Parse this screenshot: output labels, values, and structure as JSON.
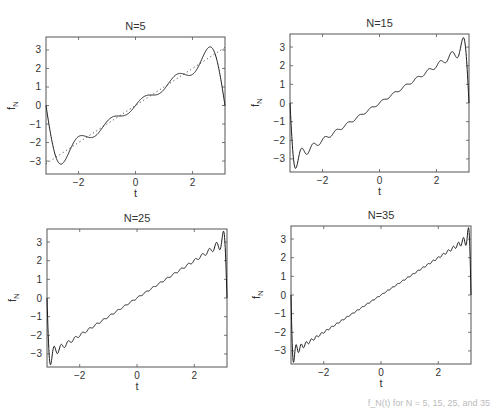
{
  "chart_data": [
    {
      "type": "line",
      "title": "N=5",
      "xlabel": "t",
      "ylabel": "f_N",
      "N": 5,
      "xlim": [
        -3.1416,
        3.1416
      ],
      "ylim": [
        -3.7,
        3.7
      ],
      "xticks": [
        -2,
        0,
        2
      ],
      "yticks": [
        -3,
        -2,
        -1,
        0,
        1,
        2,
        3
      ],
      "series": [
        {
          "name": "f_N(t)",
          "style": "solid",
          "description": "Fourier partial sum of f(t)=t with N=5 terms; peaks near ±3.2 at t≈±2.6"
        },
        {
          "name": "f(t)=t",
          "style": "dotted",
          "description": "reference line y=t"
        }
      ],
      "box": {
        "left": 46,
        "top": 37,
        "right": 225,
        "bottom": 174
      }
    },
    {
      "type": "line",
      "title": "N=15",
      "xlabel": "t",
      "ylabel": "f_N",
      "N": 15,
      "xlim": [
        -3.1416,
        3.1416
      ],
      "ylim": [
        -3.7,
        3.7
      ],
      "xticks": [
        -2,
        0,
        2
      ],
      "yticks": [
        -3,
        -2,
        -1,
        0,
        1,
        2,
        3
      ],
      "series": [
        {
          "name": "f_N(t)",
          "style": "solid",
          "description": "Fourier partial sum with N=15 terms; overshoot ~±3.5 near t≈±2.95"
        }
      ],
      "box": {
        "left": 290,
        "top": 34,
        "right": 469,
        "bottom": 172
      }
    },
    {
      "type": "line",
      "title": "N=25",
      "xlabel": "t",
      "ylabel": "f_N",
      "N": 25,
      "xlim": [
        -3.1416,
        3.1416
      ],
      "ylim": [
        -3.7,
        3.7
      ],
      "xticks": [
        -2,
        0,
        2
      ],
      "yticks": [
        -3,
        -2,
        -1,
        0,
        1,
        2,
        3
      ],
      "series": [
        {
          "name": "f_N(t)",
          "style": "solid",
          "description": "Fourier partial sum with N=25 terms; overshoot ~±3.6 near t≈±3.03"
        }
      ],
      "box": {
        "left": 47,
        "top": 229,
        "right": 227,
        "bottom": 367
      }
    },
    {
      "type": "line",
      "title": "N=35",
      "xlabel": "t",
      "ylabel": "f_N",
      "N": 35,
      "xlim": [
        -3.1416,
        3.1416
      ],
      "ylim": [
        -3.7,
        3.7
      ],
      "xticks": [
        -2,
        0,
        2
      ],
      "yticks": [
        -3,
        -2,
        -1,
        0,
        1,
        2,
        3
      ],
      "series": [
        {
          "name": "f_N(t)",
          "style": "solid",
          "description": "Fourier partial sum with N=35 terms; overshoot ~±3.65 near t≈±3.06"
        }
      ],
      "box": {
        "left": 291,
        "top": 226,
        "right": 471,
        "bottom": 364
      }
    }
  ],
  "caption": "f_N(t) for N = 5, 15, 25, and 35",
  "colors": {
    "line": "#1a1a1a",
    "axis": "#555555",
    "text": "#333333"
  }
}
